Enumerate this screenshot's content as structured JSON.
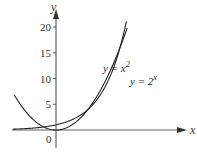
{
  "chart_data": {
    "type": "line",
    "title": "",
    "xlabel": "x",
    "ylabel": "y",
    "xlim": [
      -3,
      8.5
    ],
    "ylim": [
      -2,
      22
    ],
    "grid": false,
    "legend": "inline labels",
    "y_ticks": [
      5,
      10,
      15,
      20
    ],
    "y_tick_labels": [
      "5",
      "10",
      "15",
      "20"
    ],
    "origin_label": "0",
    "series": [
      {
        "name": "y = x^2",
        "label_text": "y = x",
        "label_sup": "2",
        "function": "x^2",
        "x": [
          -2.6,
          -2,
          -1,
          0,
          1,
          2,
          3,
          4,
          4.5
        ],
        "values": [
          6.76,
          4,
          1,
          0,
          1,
          4,
          9,
          16,
          20.25
        ]
      },
      {
        "name": "y = 2^x",
        "label_text": "y = 2",
        "label_sup": "x",
        "function": "2^x",
        "x": [
          -3,
          -2,
          -1,
          0,
          1,
          2,
          3,
          4,
          4.4
        ],
        "values": [
          0.125,
          0.25,
          0.5,
          1,
          2,
          4,
          8,
          16,
          21.1
        ]
      }
    ],
    "annotations": [
      {
        "text": "intersection",
        "x": 2,
        "y": 4
      },
      {
        "text": "intersection",
        "x": 4,
        "y": 16
      }
    ]
  },
  "colors": {
    "axis": "#555555",
    "curve": "#222222",
    "text": "#333333"
  }
}
